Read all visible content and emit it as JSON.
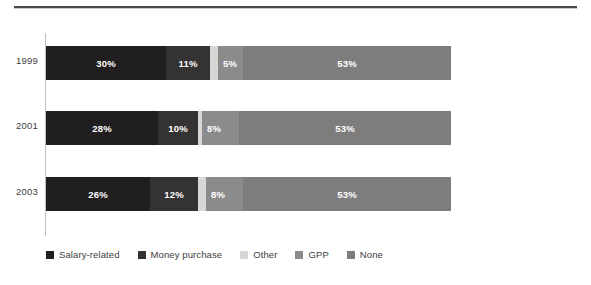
{
  "chart_data": {
    "type": "bar",
    "orientation": "horizontal",
    "stacked": true,
    "title": "",
    "xlabel": "",
    "ylabel": "",
    "xlim": [
      0,
      100
    ],
    "grid": false,
    "legend_position": "bottom-left",
    "categories": [
      "1999",
      "2001",
      "2003"
    ],
    "series": [
      {
        "name": "Salary-related",
        "color": "#201e1e",
        "values": [
          30,
          28,
          26
        ],
        "labels": [
          "30%",
          "28%",
          "26%"
        ]
      },
      {
        "name": "Money purchase",
        "color": "#343232",
        "values": [
          11,
          10,
          12
        ],
        "labels": [
          "11%",
          "10%",
          "12%"
        ]
      },
      {
        "name": "Other",
        "color": "#d7d7d7",
        "values": [
          2,
          1,
          2
        ],
        "labels": [
          "",
          "",
          ""
        ]
      },
      {
        "name": "GPP",
        "color": "#8b8b8b",
        "values": [
          5,
          8,
          8
        ],
        "labels": [
          "5%",
          "8%",
          "8%"
        ]
      },
      {
        "name": "None",
        "color": "#7d7d7d",
        "values": [
          52,
          53,
          52
        ],
        "labels": [
          "53%",
          "53%",
          "53%"
        ]
      }
    ]
  },
  "rows": [
    {
      "label": "1999",
      "segments": [
        {
          "series": "Salary-related",
          "value": 30,
          "label": "30%",
          "color": "#201e1e",
          "align": "center"
        },
        {
          "series": "Money purchase",
          "value": 11,
          "label": "11%",
          "color": "#343232",
          "align": "center"
        },
        {
          "series": "Other",
          "value": 2,
          "label": "",
          "color": "#d7d7d7",
          "align": "center"
        },
        {
          "series": "GPP",
          "value": 5,
          "label": "5%",
          "color": "#8b8b8b",
          "align": "start"
        },
        {
          "series": "None",
          "value": 52,
          "label": "53%",
          "color": "#7d7d7d",
          "align": "center"
        }
      ]
    },
    {
      "label": "2001",
      "segments": [
        {
          "series": "Salary-related",
          "value": 28,
          "label": "28%",
          "color": "#201e1e",
          "align": "center"
        },
        {
          "series": "Money purchase",
          "value": 10,
          "label": "10%",
          "color": "#343232",
          "align": "center"
        },
        {
          "series": "Other",
          "value": 1,
          "label": "",
          "color": "#d7d7d7",
          "align": "center"
        },
        {
          "series": "GPP",
          "value": 8,
          "label": "8%",
          "color": "#8b8b8b",
          "align": "start"
        },
        {
          "series": "None",
          "value": 53,
          "label": "53%",
          "color": "#7d7d7d",
          "align": "center"
        }
      ]
    },
    {
      "label": "2003",
      "segments": [
        {
          "series": "Salary-related",
          "value": 26,
          "label": "26%",
          "color": "#201e1e",
          "align": "center"
        },
        {
          "series": "Money purchase",
          "value": 12,
          "label": "12%",
          "color": "#343232",
          "align": "center"
        },
        {
          "series": "Other",
          "value": 2,
          "label": "",
          "color": "#d7d7d7",
          "align": "center"
        },
        {
          "series": "GPP",
          "value": 8,
          "label": "8%",
          "color": "#8b8b8b",
          "align": "start"
        },
        {
          "series": "None",
          "value": 52,
          "label": "53%",
          "color": "#7d7d7d",
          "align": "center"
        }
      ]
    }
  ],
  "legend": {
    "items": [
      {
        "label": "Salary-related",
        "color": "#201e1e"
      },
      {
        "label": "Money purchase",
        "color": "#343232"
      },
      {
        "label": "Other",
        "color": "#d7d7d7"
      },
      {
        "label": "GPP",
        "color": "#8b8b8b"
      },
      {
        "label": "None",
        "color": "#7d7d7d"
      }
    ]
  },
  "layout": {
    "bar_left_px": 46,
    "bar_width_px": 405,
    "bar_height_px": 34,
    "row_tops_px": [
      46,
      111,
      177
    ]
  }
}
